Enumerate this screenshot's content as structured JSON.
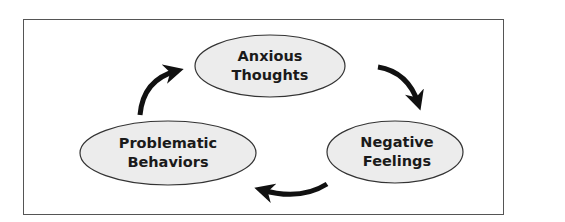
{
  "diagram": {
    "type": "cycle",
    "nodes": [
      {
        "id": "anxious-thoughts",
        "line1": "Anxious",
        "line2": "Thoughts"
      },
      {
        "id": "negative-feelings",
        "line1": "Negative",
        "line2": "Feelings"
      },
      {
        "id": "problematic-behaviors",
        "line1": "Problematic",
        "line2": "Behaviors"
      }
    ],
    "edges": [
      {
        "from": "anxious-thoughts",
        "to": "negative-feelings"
      },
      {
        "from": "negative-feelings",
        "to": "problematic-behaviors"
      },
      {
        "from": "problematic-behaviors",
        "to": "anxious-thoughts"
      }
    ],
    "colors": {
      "node_fill": "#ececec",
      "node_stroke": "#333333",
      "arrow": "#111111",
      "frame": "#555555"
    }
  }
}
